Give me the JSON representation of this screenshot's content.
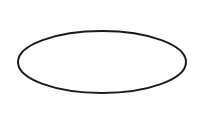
{
  "canvas": {
    "width": 203,
    "height": 121,
    "background_color": "#ffffff",
    "title": "Ellipse outline"
  },
  "diagram": {
    "type": "shape-diagram",
    "shapes": [
      {
        "name": "ellipse",
        "kind": "ellipse",
        "center_x": 102,
        "center_y": 62,
        "radius_x": 84,
        "radius_y": 31,
        "bounds": {
          "left": 18,
          "top": 31,
          "right": 186,
          "bottom": 93,
          "width": 168,
          "height": 62
        },
        "stroke_color": "#1a1a1a",
        "stroke_width": 2,
        "fill_color": "#ffffff",
        "label": ""
      }
    ]
  }
}
